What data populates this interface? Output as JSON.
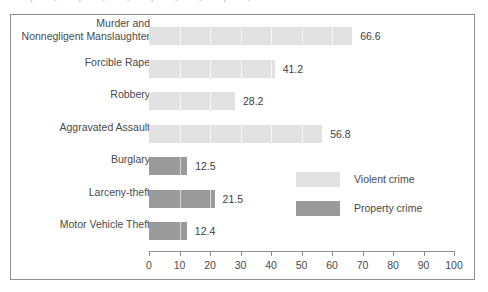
{
  "chart_data": {
    "type": "bar",
    "orientation": "horizontal",
    "title": "",
    "xlabel": "",
    "ylabel": "",
    "xlim": [
      0,
      100
    ],
    "xticks": [
      0,
      10,
      20,
      30,
      40,
      50,
      60,
      70,
      80,
      90,
      100
    ],
    "xtick_labels": [
      "0",
      "10",
      "20",
      "30",
      "40",
      "50",
      "60",
      "70",
      "80",
      "90",
      "100"
    ],
    "grid": false,
    "legend_position": "middle-right",
    "categories": [
      "Murder and\nNonnegligent Manslaughter",
      "Forcible Rape",
      "Robbery",
      "Aggravated Assault",
      "Burglary",
      "Larceny-theft",
      "Motor Vehicle Theft"
    ],
    "values": [
      66.6,
      41.2,
      28.2,
      56.8,
      12.5,
      21.5,
      12.4
    ],
    "value_labels": [
      "66.6",
      "41.2",
      "28.2",
      "56.8",
      "12.5",
      "21.5",
      "12.4"
    ],
    "groups": [
      "Violent crime",
      "Violent crime",
      "Violent crime",
      "Violent crime",
      "Property crime",
      "Property crime",
      "Property crime"
    ],
    "series": [
      {
        "name": "Violent crime",
        "color": "#e2e2e2",
        "points": [
          {
            "category": "Murder and\nNonnegligent Manslaughter",
            "value": 66.6
          },
          {
            "category": "Forcible Rape",
            "value": 41.2
          },
          {
            "category": "Robbery",
            "value": 28.2
          },
          {
            "category": "Aggravated Assault",
            "value": 56.8
          }
        ]
      },
      {
        "name": "Property crime",
        "color": "#9a9a9a",
        "points": [
          {
            "category": "Burglary",
            "value": 12.5
          },
          {
            "category": "Larceny-theft",
            "value": 21.5
          },
          {
            "category": "Motor Vehicle Theft",
            "value": 12.4
          }
        ]
      }
    ],
    "legend": [
      {
        "label": "Violent crime",
        "color": "#e2e2e2"
      },
      {
        "label": "Property crime",
        "color": "#9a9a9a"
      }
    ]
  },
  "rows": [
    {
      "label": "Murder and\nNonnegligent Manslaughter",
      "value": 66.6,
      "value_label": "66.6",
      "group": "violent"
    },
    {
      "label": "Forcible Rape",
      "value": 41.2,
      "value_label": "41.2",
      "group": "violent"
    },
    {
      "label": "Robbery",
      "value": 28.2,
      "value_label": "28.2",
      "group": "violent"
    },
    {
      "label": "Aggravated Assault",
      "value": 56.8,
      "value_label": "56.8",
      "group": "violent"
    },
    {
      "label": "Burglary",
      "value": 12.5,
      "value_label": "12.5",
      "group": "property"
    },
    {
      "label": "Larceny-theft",
      "value": 21.5,
      "value_label": "21.5",
      "group": "property"
    },
    {
      "label": "Motor Vehicle Theft",
      "value": 12.4,
      "value_label": "12.4",
      "group": "property"
    }
  ],
  "axis": {
    "ticks": [
      "0",
      "10",
      "20",
      "30",
      "40",
      "50",
      "60",
      "70",
      "80",
      "90",
      "100"
    ]
  },
  "legend": {
    "violent_label": "Violent crime",
    "property_label": "Property crime"
  },
  "colors": {
    "violent": "#e2e2e2",
    "property": "#9a9a9a",
    "frame": "#8f8f8f",
    "text": "#4a4a4a",
    "axis": "#8d8d8d"
  }
}
